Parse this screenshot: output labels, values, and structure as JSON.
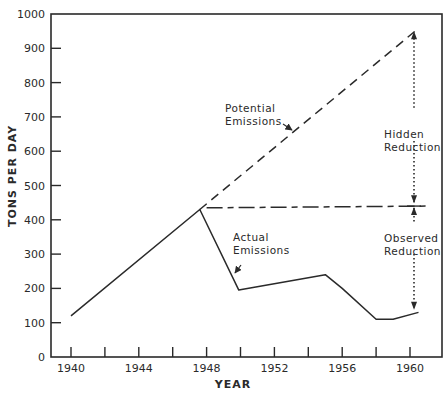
{
  "chart_data": {
    "type": "line",
    "title": "",
    "xlabel": "YEAR",
    "ylabel": "TONS PER DAY",
    "xlim": [
      1939,
      1962
    ],
    "ylim": [
      0,
      1000
    ],
    "grid": false,
    "x_ticks": [
      1940,
      1942,
      1944,
      1946,
      1948,
      1950,
      1952,
      1954,
      1956,
      1958,
      1960
    ],
    "x_tick_labels": [
      "1940",
      "1944",
      "1948",
      "1952",
      "1956",
      "1960"
    ],
    "y_ticks": [
      0,
      100,
      200,
      300,
      400,
      500,
      600,
      700,
      800,
      900,
      1000
    ],
    "y_tick_labels": [
      "0",
      "100",
      "200",
      "300",
      "400",
      "500",
      "600",
      "700",
      "800",
      "900",
      "1000"
    ],
    "series": [
      {
        "name": "Actual Emissions",
        "style": "solid",
        "x": [
          1940,
          1947.6,
          1949.9,
          1955,
          1956,
          1958,
          1959,
          1960.5
        ],
        "y": [
          120,
          430,
          195,
          240,
          200,
          110,
          110,
          130
        ]
      },
      {
        "name": "Potential Emissions",
        "style": "dashed",
        "x": [
          1947.6,
          1960.3
        ],
        "y": [
          430,
          950
        ]
      },
      {
        "name": "Baseline (1948 level)",
        "style": "dash-dot",
        "x": [
          1948,
          1961
        ],
        "y": [
          435,
          440
        ]
      }
    ],
    "annotations": [
      {
        "text": [
          "Potential",
          "Emissions"
        ],
        "x": 1951,
        "y": 695,
        "arrow_to": [
          1955.9,
          680
        ]
      },
      {
        "text": [
          "Actual",
          "Emissions"
        ],
        "x": 1950.1,
        "y": 300,
        "arrow_to": [
          1949.6,
          250
        ]
      },
      {
        "text": [
          "Hidden",
          "Reduction"
        ],
        "x": 1958.5,
        "y": 680,
        "range": [
          440,
          950
        ],
        "style": "dotted-double-arrow"
      },
      {
        "text": [
          "Observed",
          "Reduction"
        ],
        "x": 1958.5,
        "y": 345,
        "range": [
          130,
          440
        ],
        "style": "dotted-double-arrow"
      }
    ],
    "legend": "none (inline annotations)"
  },
  "labels": {
    "ylabel": "TONS PER DAY",
    "xlabel": "YEAR",
    "potential": [
      "Potential",
      "Emissions"
    ],
    "actual": [
      "Actual",
      "Emissions"
    ],
    "hidden": [
      "Hidden",
      "Reduction"
    ],
    "observed": [
      "Observed",
      "Reduction"
    ]
  },
  "colors": {
    "ink": "#2a2a2a",
    "background": "#ffffff"
  }
}
